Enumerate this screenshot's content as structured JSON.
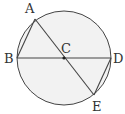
{
  "diagram": {
    "type": "geometry-circle",
    "circle": {
      "center": "C",
      "cx": 64,
      "cy": 58,
      "r": 47,
      "fill": "#f2f2f2",
      "stroke": "#444444"
    },
    "points": [
      {
        "id": "A",
        "label": "A",
        "x": 35,
        "y": 19,
        "lx": 25,
        "ly": 13
      },
      {
        "id": "B",
        "label": "B",
        "x": 17,
        "y": 58,
        "lx": 4,
        "ly": 63
      },
      {
        "id": "C",
        "label": "C",
        "x": 64,
        "y": 58,
        "lx": 61,
        "ly": 53
      },
      {
        "id": "D",
        "label": "D",
        "x": 111,
        "y": 58,
        "lx": 113,
        "ly": 63
      },
      {
        "id": "E",
        "label": "E",
        "x": 94,
        "y": 95,
        "lx": 92,
        "ly": 111
      }
    ],
    "segments": [
      [
        "A",
        "B"
      ],
      [
        "A",
        "E"
      ],
      [
        "B",
        "D"
      ],
      [
        "D",
        "E"
      ]
    ]
  }
}
